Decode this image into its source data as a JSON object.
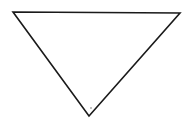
{
  "figure": {
    "shape": "inverted-triangle",
    "stroke_color": "#1a1a1a",
    "background": "#ffffff",
    "vertices": {
      "top_left": [
        13,
        12
      ],
      "top_right": [
        180,
        13
      ],
      "bottom": [
        89,
        116
      ]
    },
    "dot": [
      91,
      108
    ]
  }
}
